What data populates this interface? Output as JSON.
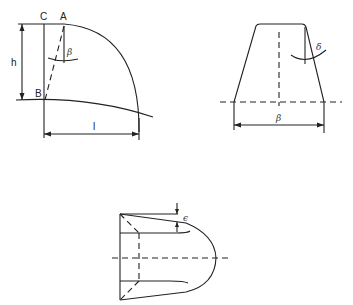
{
  "figure": {
    "top_left": {
      "labels": {
        "point_c": "C",
        "point_a": "A",
        "point_b": "B",
        "height": "h",
        "length": "l",
        "angle": "β"
      }
    },
    "top_right": {
      "labels": {
        "angle": "δ",
        "width": "β"
      }
    },
    "bottom": {
      "labels": {
        "angle": "ϵ"
      }
    }
  },
  "colors": {
    "line": "#222222",
    "background": "#ffffff"
  }
}
